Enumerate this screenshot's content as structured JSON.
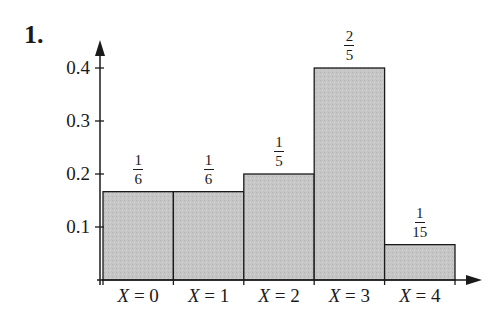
{
  "problem_number": "1.",
  "chart_data": {
    "type": "bar",
    "title": "",
    "xlabel": "",
    "ylabel": "",
    "categories": [
      "X = 0",
      "X = 1",
      "X = 2",
      "X = 3",
      "X = 4"
    ],
    "values": [
      0.1667,
      0.1667,
      0.2,
      0.4,
      0.0667
    ],
    "value_labels": [
      {
        "num": "1",
        "den": "6"
      },
      {
        "num": "1",
        "den": "6"
      },
      {
        "num": "1",
        "den": "5"
      },
      {
        "num": "2",
        "den": "5"
      },
      {
        "num": "1",
        "den": "15"
      }
    ],
    "yticks": [
      "0.1",
      "0.2",
      "0.3",
      "0.4"
    ],
    "ylim": [
      0,
      0.45
    ],
    "grid": false,
    "bar_color": "#c4c4c4",
    "edge_color": "#1a1a1a"
  },
  "x_labels": [
    {
      "var": "X",
      "rest": " = 0"
    },
    {
      "var": "X",
      "rest": " = 1"
    },
    {
      "var": "X",
      "rest": " = 2"
    },
    {
      "var": "X",
      "rest": " = 3"
    },
    {
      "var": "X",
      "rest": " = 4"
    }
  ]
}
